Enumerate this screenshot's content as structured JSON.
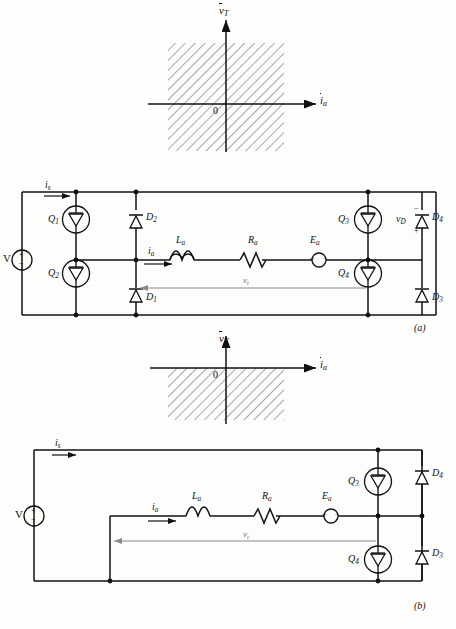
{
  "figure": {
    "caption_a": "(a)",
    "caption_b": "(b)"
  },
  "quadrant_charts": [
    {
      "id": "quadrant-chart-four",
      "y_axis_label_base": "v",
      "y_axis_label_sub": "T",
      "x_axis_label_base": "i",
      "x_axis_label_sub": "a",
      "origin_label": "0",
      "shaded_quadrants": [
        "I",
        "II",
        "III",
        "IV"
      ],
      "description": "four-quadrant operating region"
    },
    {
      "id": "quadrant-chart-two",
      "y_axis_label_base": "v",
      "y_axis_label_sub": "T",
      "x_axis_label_base": "i",
      "x_axis_label_sub": "a",
      "origin_label": "0",
      "shaded_quadrants": [
        "III",
        "IV"
      ],
      "description": "two-quadrant operating region, negative voltage half"
    }
  ],
  "circuits": [
    {
      "id": "circuit-a",
      "caption": "(a)",
      "source_label": "V",
      "source_plus": "+",
      "source_minus": "−",
      "supply_current_base": "i",
      "supply_current_sub": "s",
      "armature_current_base": "i",
      "armature_current_sub": "a",
      "terminal_voltage_base": "v",
      "terminal_voltage_sub": "t",
      "inductor_base": "L",
      "inductor_sub": "a",
      "resistor_base": "R",
      "resistor_sub": "a",
      "emf_base": "E",
      "emf_sub": "a",
      "emf_plus": "+",
      "emf_minus": "−",
      "diode_voltage_base": "v",
      "diode_voltage_sub": "D",
      "diode_voltage_minus": "−",
      "diode_voltage_plus": "+",
      "switches": [
        {
          "base": "Q",
          "sub": "1"
        },
        {
          "base": "Q",
          "sub": "2"
        },
        {
          "base": "Q",
          "sub": "3"
        },
        {
          "base": "Q",
          "sub": "4"
        }
      ],
      "diodes": [
        {
          "base": "D",
          "sub": "1"
        },
        {
          "base": "D",
          "sub": "2"
        },
        {
          "base": "D",
          "sub": "3"
        },
        {
          "base": "D",
          "sub": "4"
        }
      ]
    },
    {
      "id": "circuit-b",
      "caption": "(b)",
      "source_label": "V",
      "source_plus": "+",
      "source_minus": "−",
      "supply_current_base": "i",
      "supply_current_sub": "s",
      "armature_current_base": "i",
      "armature_current_sub": "a",
      "terminal_voltage_base": "v",
      "terminal_voltage_sub": "t",
      "inductor_base": "L",
      "inductor_sub": "a",
      "resistor_base": "R",
      "resistor_sub": "a",
      "emf_base": "E",
      "emf_sub": "a",
      "emf_plus": "+",
      "emf_minus": "−",
      "switches": [
        {
          "base": "Q",
          "sub": "3"
        },
        {
          "base": "Q",
          "sub": "4"
        }
      ],
      "diodes": [
        {
          "base": "D",
          "sub": "3"
        },
        {
          "base": "D",
          "sub": "4"
        }
      ]
    }
  ],
  "colors": {
    "ink": "#111111",
    "hatch": "#555555",
    "faint": "#888888",
    "paper": "#fdfdfb"
  }
}
